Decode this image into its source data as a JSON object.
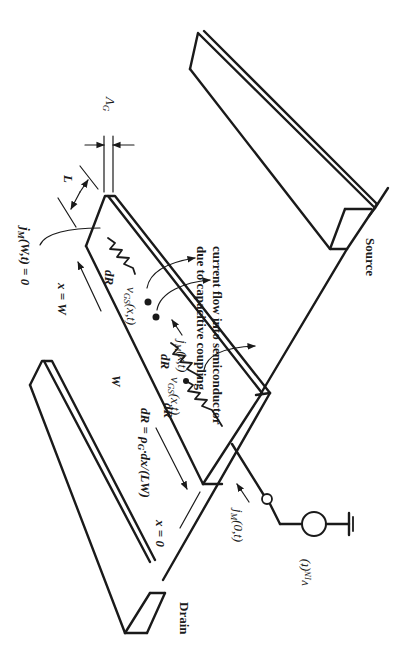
{
  "diagram": {
    "orientation": "rotated 90 degrees clockwise",
    "electrodes": {
      "source_label": "Source",
      "drain_label": "Drain"
    },
    "gate": {
      "thickness_symbol": "Λ",
      "thickness_subscript": "G",
      "length_symbol": "L",
      "width_symbol": "W"
    },
    "boundary": {
      "x_end": "x = W",
      "x_start": "x = 0",
      "end_condition_main": "j",
      "end_condition_sub": "M",
      "end_condition_tail": "(W,t) = 0"
    },
    "resistance": {
      "element_label": "dR",
      "formula_lhs": "dR = ",
      "formula_rho": "ρ",
      "formula_rho_sub": "G",
      "formula_rest": "·dx/(LW)"
    },
    "internal": {
      "vgs_main": "v",
      "vgs_sub": "GS",
      "vgs_tail": "(x,t)",
      "jm_main": "j",
      "jm_sub": "M",
      "jm_tail": "(x,t)"
    },
    "coupling_note": {
      "line1": "current flow into semiconductor",
      "line2": "due to capacitive coupling"
    },
    "input": {
      "current_main": "j",
      "current_sub": "M",
      "current_tail": "(0,t)",
      "source_main": "v",
      "source_sub": "IN",
      "source_tail": "(t)"
    },
    "colors": {
      "ink": "#1a1a1a",
      "background": "#ffffff"
    }
  }
}
